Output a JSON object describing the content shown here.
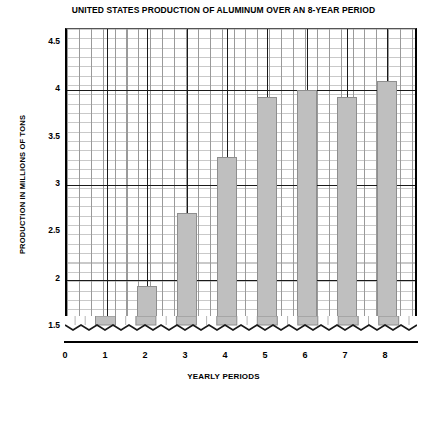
{
  "chart_data": {
    "type": "bar",
    "title": "UNITED STATES PRODUCTION OF ALUMINUM OVER AN 8-YEAR PERIOD",
    "xlabel": "YEARLY PERIODS",
    "ylabel": "PRODUCTION IN MILLIONS OF TONS",
    "categories": [
      "1",
      "2",
      "3",
      "4",
      "5",
      "6",
      "7",
      "8"
    ],
    "values": [
      1.4,
      1.93,
      2.7,
      3.3,
      3.93,
      4.0,
      3.93,
      4.1
    ],
    "x_tick_labels": [
      "0",
      "1",
      "2",
      "3",
      "4",
      "5",
      "6",
      "7",
      "8"
    ],
    "y_tick_labels": [
      "4.5",
      "4",
      "3.5",
      "3",
      "2.5",
      "2",
      "1.5"
    ],
    "y_tick_values": [
      4.5,
      4,
      3.5,
      3,
      2.5,
      2,
      1.5
    ],
    "ylim": [
      1.35,
      4.65
    ],
    "xlim": [
      0,
      8.7
    ],
    "grid": true,
    "axis_break": true,
    "legend": "none",
    "bar_color": "#bfbfbf",
    "grid_color": "#c9c9c9",
    "major_grid_color": "#1a1a1a",
    "axis_color": "#000000"
  }
}
